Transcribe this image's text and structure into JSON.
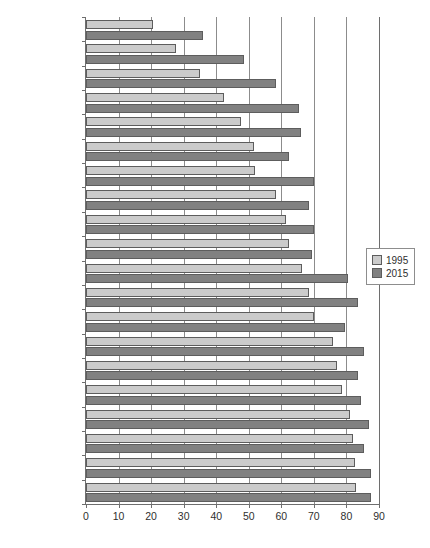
{
  "chart_data": {
    "type": "bar",
    "orientation": "horizontal",
    "title": "",
    "xlabel": "",
    "ylabel": "",
    "xlim": [
      0,
      90
    ],
    "xticks": [
      0,
      10,
      20,
      30,
      40,
      50,
      60,
      70,
      80,
      90
    ],
    "grid": true,
    "legend_position": "right",
    "categories": [
      "Portugal",
      "Spain",
      "Italy",
      "Greece",
      "Ireland",
      "Australia",
      "Belgium",
      "New Zealand",
      "Netherlands",
      "Denmark",
      "Finland",
      "France",
      "Austria",
      "Sweden",
      "Canada",
      "UK",
      "Norway",
      "Switzerland",
      "Germany",
      "US"
    ],
    "emphasized_categories": [
      "Ireland"
    ],
    "series": [
      {
        "name": "1995",
        "color": "#cbcbcb",
        "values": [
          20.5,
          27.5,
          35,
          42.5,
          47.5,
          51.5,
          52,
          58.5,
          61.5,
          62.5,
          66.5,
          68.5,
          70,
          76,
          77,
          78.5,
          81,
          82,
          82.5,
          83
        ]
      },
      {
        "name": "2015",
        "color": "#818181",
        "values": [
          36,
          48.5,
          58.5,
          65.5,
          66,
          62.5,
          70,
          68.5,
          70,
          69.5,
          80.5,
          83.5,
          79.5,
          85.5,
          83.5,
          84.5,
          87,
          85.5,
          87.5,
          87.5
        ]
      }
    ]
  }
}
